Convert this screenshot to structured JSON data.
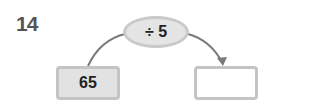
{
  "question_number": "14",
  "operation": "÷ 5",
  "input_value": "65",
  "output_value": "",
  "colors": {
    "arrow": "#7a7a7a",
    "box_fill": "#e2e2e2",
    "box_border": "#c4c4c4",
    "text": "#222222",
    "number": "#555555"
  }
}
